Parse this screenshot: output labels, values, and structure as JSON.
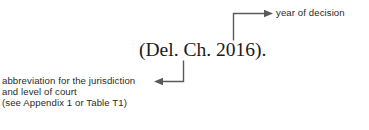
{
  "figure": {
    "background_color": "#ffffff",
    "line_color": "#5a5a5a",
    "text_color": "#2b2b2b",
    "citation_color": "#1a1a1a"
  },
  "citation": {
    "text": "(Del. Ch. 2016)."
  },
  "annotations": {
    "year": {
      "label": "year of decision",
      "target": "2016"
    },
    "court": {
      "line1": "abbreviation for the jurisdiction",
      "line2": "and level of court",
      "line3": "(see Appendix 1 or Table T1)",
      "target": "Del. Ch."
    }
  }
}
